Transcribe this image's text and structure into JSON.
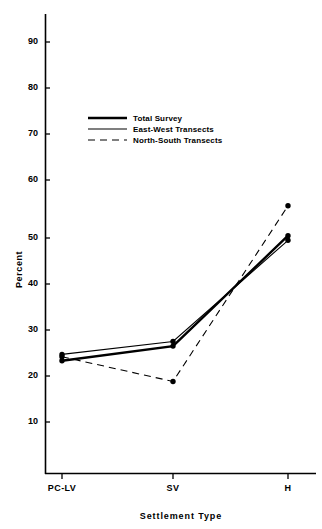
{
  "chart_data": {
    "type": "line",
    "title": "",
    "xlabel": "Settlement Type",
    "ylabel": "Percent",
    "categories": [
      "PC-LV",
      "SV",
      "H"
    ],
    "ylim": [
      0,
      95
    ],
    "yticks": [
      10,
      20,
      30,
      40,
      50,
      60,
      70,
      80,
      90
    ],
    "ytick_labels": [
      "10",
      "20",
      "30",
      "40",
      "50",
      "60",
      "70",
      "80",
      "90"
    ],
    "grid": false,
    "legend_position": "upper-left-inside",
    "series": [
      {
        "name": "Total Survey",
        "style": "thick-solid",
        "marker": "filled-circle",
        "values": [
          23.3,
          26.5,
          50.5
        ]
      },
      {
        "name": "East-West Transects",
        "style": "thin-solid",
        "marker": "filled-circle",
        "values": [
          24.7,
          27.5,
          49.5
        ]
      },
      {
        "name": "North-South Transects",
        "style": "dashed",
        "marker": "filled-circle",
        "values": [
          24.2,
          18.8,
          57.0
        ]
      }
    ],
    "colors": {
      "line": "#000000",
      "marker": "#000000",
      "axis": "#000000",
      "background": "#ffffff"
    }
  },
  "axis": {
    "y_title": "Percent",
    "x_title": "Settlement Type",
    "y_ticks": [
      "90",
      "80",
      "70",
      "60",
      "50",
      "40",
      "30",
      "20",
      "10"
    ],
    "x_ticks": [
      "PC-LV",
      "SV",
      "H"
    ]
  },
  "legend": {
    "items": [
      {
        "label": "Total Survey"
      },
      {
        "label": "East-West Transects"
      },
      {
        "label": "North-South Transects"
      }
    ]
  }
}
